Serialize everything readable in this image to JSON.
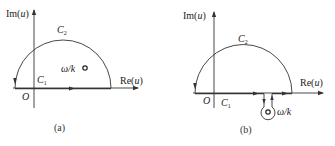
{
  "panels": [
    {
      "id": "a",
      "caption": "(a)",
      "im_axis_label": "Im(u)",
      "re_axis_label": "Re(u)",
      "origin_label": "O",
      "contour_arc_label": "C",
      "contour_arc_sub": "2",
      "contour_line_label": "C",
      "contour_line_sub": "1",
      "pole_label": "ω/k",
      "pole_position": "upper half-plane, inside contour"
    },
    {
      "id": "b",
      "caption": "(b)",
      "im_axis_label": "Im(u)",
      "re_axis_label": "Re(u)",
      "origin_label": "O",
      "contour_arc_label": "C",
      "contour_arc_sub": "2",
      "contour_line_label": "C",
      "contour_line_sub": "1",
      "pole_label": "ω/k",
      "pole_position": "lower half-plane, keyhole detour"
    }
  ],
  "colors": {
    "line": "#333333",
    "text": "#222222",
    "background": "#ffffff"
  }
}
